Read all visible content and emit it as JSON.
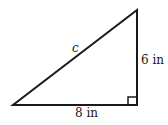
{
  "diagram": {
    "type": "right-triangle",
    "labels": {
      "hypotenuse": "c",
      "vertical_leg": "6 in",
      "horizontal_leg": "8 in"
    },
    "right_angle_marker": true,
    "colors": {
      "stroke": "#1a1a1a",
      "background": "#ffffff"
    }
  }
}
